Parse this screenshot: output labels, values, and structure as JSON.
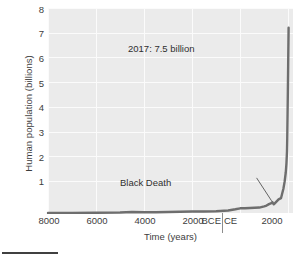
{
  "chart_data": {
    "type": "line",
    "title": "",
    "subtitle": "",
    "xlabel": "Time (years)",
    "ylabel": "Human population (billions)",
    "grid": true,
    "legend": "none",
    "xlim": [
      -8000,
      2200
    ],
    "ylim": [
      0,
      8.3
    ],
    "x_tick_labels": [
      "8000",
      "6000",
      "4000",
      "2000",
      "BCE",
      "CE",
      "2000"
    ],
    "x_tick_values": [
      -8000,
      -6000,
      -4000,
      -2000,
      -200,
      200,
      2000
    ],
    "y_tick_labels": [
      "1",
      "2",
      "3",
      "4",
      "5",
      "6",
      "7",
      "8"
    ],
    "y_tick_values": [
      1,
      2,
      3,
      4,
      5,
      6,
      7,
      8
    ],
    "era_divider_label": "BCE / CE boundary at year 0",
    "series": [
      {
        "name": "Human population",
        "color": "#6e6e6e",
        "x": [
          -8000,
          -7000,
          -6000,
          -5000,
          -4500,
          -4000,
          -3500,
          -3000,
          -2500,
          -2000,
          -1500,
          -1000,
          -500,
          -200,
          0,
          200,
          400,
          600,
          800,
          1000,
          1100,
          1200,
          1300,
          1340,
          1400,
          1500,
          1600,
          1700,
          1750,
          1800,
          1850,
          1900,
          1927,
          1950,
          1960,
          1974,
          1987,
          1999,
          2011,
          2017
        ],
        "y": [
          0.005,
          0.007,
          0.01,
          0.02,
          0.04,
          0.03,
          0.03,
          0.04,
          0.05,
          0.06,
          0.06,
          0.07,
          0.1,
          0.15,
          0.19,
          0.19,
          0.2,
          0.21,
          0.22,
          0.27,
          0.3,
          0.36,
          0.4,
          0.44,
          0.35,
          0.45,
          0.55,
          0.6,
          0.79,
          0.98,
          1.26,
          1.65,
          2.0,
          2.5,
          3.0,
          4.0,
          5.0,
          6.0,
          7.0,
          7.5
        ]
      }
    ],
    "annotations": [
      {
        "id": "population-2017",
        "text": "2017: 7.5 billion",
        "x": 2017,
        "y": 7.5
      },
      {
        "id": "black-death",
        "text": "Black Death",
        "x": 1350,
        "y": 0.37,
        "leader_line": true
      }
    ]
  }
}
